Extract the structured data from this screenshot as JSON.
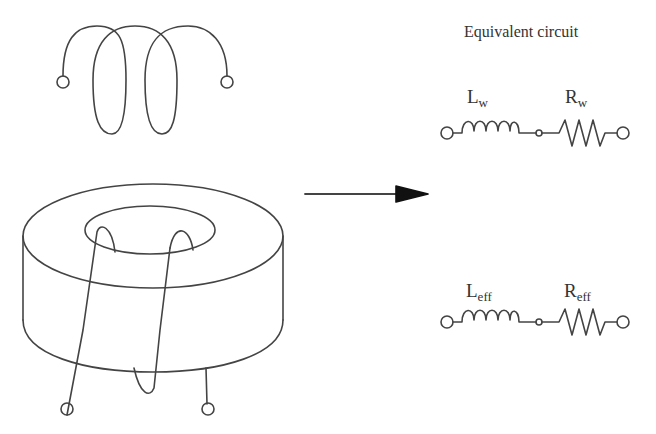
{
  "diagram": {
    "title": "Equivalent circuit",
    "colors": {
      "stroke": "#444444",
      "background": "#ffffff",
      "text": "#333333"
    },
    "left_drawings": [
      {
        "id": "air-coil",
        "description": "helical wire coil with two terminals (air core)"
      },
      {
        "id": "toroid-coil",
        "description": "wire wound through toroidal core with two terminals"
      }
    ],
    "arrow": {
      "direction": "right"
    },
    "circuits": [
      {
        "id": "winding-circuit",
        "inductor": {
          "symbol": "L",
          "subscript": "w"
        },
        "resistor": {
          "symbol": "R",
          "subscript": "w"
        }
      },
      {
        "id": "effective-circuit",
        "inductor": {
          "symbol": "L",
          "subscript": "eff"
        },
        "resistor": {
          "symbol": "R",
          "subscript": "eff"
        }
      }
    ]
  }
}
